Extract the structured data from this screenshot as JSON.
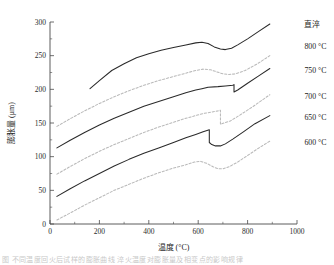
{
  "chart_data": {
    "type": "line",
    "title": "",
    "xlabel": "温度 (°C)",
    "ylabel": "膨胀量 (μm)",
    "xlim": [
      0,
      1000
    ],
    "ylim": [
      0,
      300
    ],
    "xticks": [
      0,
      200,
      400,
      600,
      800,
      1000
    ],
    "xticklabels": [
      "0",
      "200",
      "400",
      "600",
      "800",
      "1000"
    ],
    "yticks": [
      0,
      50,
      100,
      150,
      200,
      250,
      300
    ],
    "yticklabels": [
      "0",
      "50",
      "100",
      "150",
      "200",
      "250",
      "300"
    ],
    "xminorticks": [
      100,
      300,
      500,
      700,
      900
    ],
    "yminorticks": [
      25,
      75,
      125,
      175,
      225,
      275
    ],
    "grid": false,
    "legend_position": "right-outside-inline-labels",
    "series": [
      {
        "name": "直淬",
        "style": "solid",
        "color": "#2a2a2a",
        "label_x": 1030,
        "label_y": 296,
        "points": [
          [
            162,
            201
          ],
          [
            200,
            213
          ],
          [
            250,
            228
          ],
          [
            300,
            238
          ],
          [
            350,
            247
          ],
          [
            400,
            253
          ],
          [
            450,
            258
          ],
          [
            500,
            262
          ],
          [
            550,
            266
          ],
          [
            590,
            269
          ],
          [
            615,
            270
          ],
          [
            640,
            268
          ],
          [
            665,
            263
          ],
          [
            690,
            260
          ],
          [
            710,
            259
          ],
          [
            735,
            261
          ],
          [
            760,
            266
          ],
          [
            800,
            275
          ],
          [
            845,
            286
          ],
          [
            890,
            297
          ]
        ]
      },
      {
        "name": "800 °C",
        "style": "dashed",
        "color": "#b9b9b9",
        "label_x": 1030,
        "label_y": 264,
        "points": [
          [
            28,
            145
          ],
          [
            80,
            156
          ],
          [
            140,
            168
          ],
          [
            200,
            179
          ],
          [
            260,
            189
          ],
          [
            320,
            198
          ],
          [
            380,
            206
          ],
          [
            440,
            213
          ],
          [
            500,
            219
          ],
          [
            550,
            224
          ],
          [
            590,
            228
          ],
          [
            620,
            230
          ],
          [
            650,
            229
          ],
          [
            675,
            226
          ],
          [
            700,
            223
          ],
          [
            725,
            222
          ],
          [
            750,
            223
          ],
          [
            790,
            228
          ],
          [
            840,
            238
          ],
          [
            890,
            250
          ]
        ]
      },
      {
        "name": "750 °C",
        "style": "solid",
        "color": "#2a2a2a",
        "label_x": 1030,
        "label_y": 228,
        "points": [
          [
            28,
            113
          ],
          [
            80,
            124
          ],
          [
            140,
            136
          ],
          [
            200,
            147
          ],
          [
            260,
            157
          ],
          [
            320,
            166
          ],
          [
            380,
            175
          ],
          [
            440,
            182
          ],
          [
            500,
            189
          ],
          [
            550,
            195
          ],
          [
            590,
            199
          ],
          [
            615,
            201
          ],
          [
            640,
            203
          ],
          [
            680,
            204
          ],
          [
            710,
            205
          ],
          [
            740,
            206
          ],
          [
            745,
            207
          ],
          [
            745,
            196
          ],
          [
            760,
            199
          ],
          [
            800,
            209
          ],
          [
            845,
            220
          ],
          [
            890,
            231
          ]
        ]
      },
      {
        "name": "700 °C",
        "style": "dashed",
        "color": "#b9b9b9",
        "label_x": 1030,
        "label_y": 190,
        "points": [
          [
            28,
            74
          ],
          [
            80,
            85
          ],
          [
            140,
            97
          ],
          [
            200,
            108
          ],
          [
            260,
            118
          ],
          [
            320,
            127
          ],
          [
            380,
            136
          ],
          [
            440,
            144
          ],
          [
            500,
            151
          ],
          [
            550,
            157
          ],
          [
            590,
            161
          ],
          [
            620,
            164
          ],
          [
            650,
            166
          ],
          [
            680,
            168
          ],
          [
            690,
            169
          ],
          [
            690,
            148
          ],
          [
            705,
            150
          ],
          [
            730,
            153
          ],
          [
            770,
            162
          ],
          [
            820,
            174
          ],
          [
            890,
            192
          ]
        ]
      },
      {
        "name": "650 °C",
        "style": "solid",
        "color": "#2a2a2a",
        "label_x": 1030,
        "label_y": 159,
        "points": [
          [
            28,
            41
          ],
          [
            80,
            52
          ],
          [
            140,
            64
          ],
          [
            200,
            75
          ],
          [
            260,
            86
          ],
          [
            320,
            96
          ],
          [
            380,
            105
          ],
          [
            440,
            113
          ],
          [
            500,
            121
          ],
          [
            550,
            128
          ],
          [
            590,
            133
          ],
          [
            620,
            137
          ],
          [
            645,
            140
          ],
          [
            645,
            121
          ],
          [
            655,
            118
          ],
          [
            670,
            116
          ],
          [
            690,
            116
          ],
          [
            710,
            119
          ],
          [
            740,
            126
          ],
          [
            780,
            136
          ],
          [
            830,
            149
          ],
          [
            890,
            161
          ]
        ]
      },
      {
        "name": "600 °C",
        "style": "dashed",
        "color": "#b9b9b9",
        "label_x": 1030,
        "label_y": 121,
        "points": [
          [
            28,
            6
          ],
          [
            80,
            16
          ],
          [
            140,
            28
          ],
          [
            200,
            39
          ],
          [
            260,
            50
          ],
          [
            320,
            59
          ],
          [
            380,
            68
          ],
          [
            440,
            76
          ],
          [
            500,
            83
          ],
          [
            550,
            88
          ],
          [
            585,
            92
          ],
          [
            610,
            93
          ],
          [
            635,
            90
          ],
          [
            660,
            85
          ],
          [
            680,
            82
          ],
          [
            700,
            82
          ],
          [
            725,
            85
          ],
          [
            760,
            92
          ],
          [
            805,
            103
          ],
          [
            850,
            114
          ],
          [
            890,
            123
          ]
        ]
      }
    ]
  },
  "caption": {
    "footer_text": "图 不同温度回火后试样的膨胀曲线 淬火温度对膨胀量及相变点的影响规律"
  }
}
